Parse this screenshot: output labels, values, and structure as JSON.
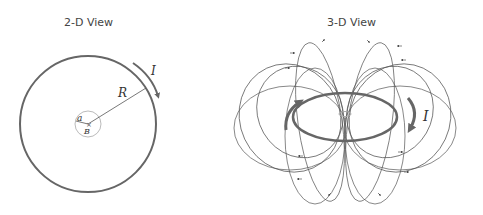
{
  "left_panel": {
    "title": "2-D View",
    "labels": {
      "radius": "R",
      "current": "I",
      "inner_radius": "a",
      "field": "B"
    }
  },
  "right_panel": {
    "title": "3-D View",
    "labels": {
      "current": "I"
    }
  },
  "colors": {
    "loop": "#666666",
    "field_lines": "#555555",
    "inner": "#aaaaaa"
  }
}
